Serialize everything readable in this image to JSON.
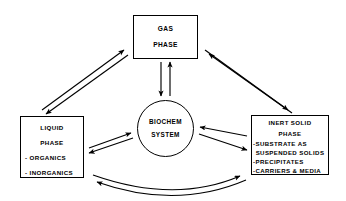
{
  "diagram": {
    "background_color": "#ffffff",
    "stroke_color": "#000000",
    "nodes": {
      "gas_phase": {
        "name": "gas-phase",
        "shape": "rectangle",
        "line1": "GAS",
        "line2": "PHASE"
      },
      "liquid_phase": {
        "name": "liquid-phase",
        "shape": "rectangle",
        "line1": "LIQUID",
        "line2": "PHASE",
        "item1": "- ORGANICS",
        "item2": "- INORGANICS"
      },
      "inert_solid_phase": {
        "name": "inert-solid-phase",
        "shape": "rectangle",
        "line1": "INERT SOLID",
        "line2": "PHASE",
        "item1": "-SUBSTRATE  AS",
        "item1_cont": "SUSPENDED  SOLIDS",
        "item2": "-PRECIPITATES",
        "item3": "-CARRIERS  &  MEDIA"
      },
      "biochem_system": {
        "name": "biochem-system",
        "shape": "circle",
        "line1": "BIOCHEM",
        "line2": "SYSTEM"
      }
    },
    "connectors": [
      {
        "name": "liquid-to-gas-arrow",
        "from": "liquid-phase",
        "to": "gas-phase",
        "style": "straight",
        "direction": "up-right"
      },
      {
        "name": "gas-to-liquid-arrow",
        "from": "gas-phase",
        "to": "liquid-phase",
        "style": "straight",
        "direction": "down-left"
      },
      {
        "name": "gas-to-inert-solid-arrow",
        "from": "gas-phase",
        "to": "inert-solid-phase",
        "style": "straight",
        "direction": "down-right"
      },
      {
        "name": "inert-solid-to-gas-arrow",
        "from": "inert-solid-phase",
        "to": "gas-phase",
        "style": "straight",
        "direction": "up-left"
      },
      {
        "name": "gas-to-biochem-arrow",
        "from": "gas-phase",
        "to": "biochem-system",
        "style": "straight",
        "direction": "down"
      },
      {
        "name": "biochem-to-gas-arrow",
        "from": "biochem-system",
        "to": "gas-phase",
        "style": "straight",
        "direction": "up"
      },
      {
        "name": "liquid-to-biochem-arrow",
        "from": "liquid-phase",
        "to": "biochem-system",
        "style": "straight",
        "direction": "right"
      },
      {
        "name": "biochem-to-liquid-arrow",
        "from": "biochem-system",
        "to": "liquid-phase",
        "style": "straight",
        "direction": "left"
      },
      {
        "name": "biochem-to-inert-solid-arrow",
        "from": "biochem-system",
        "to": "inert-solid-phase",
        "style": "straight",
        "direction": "right"
      },
      {
        "name": "inert-solid-to-biochem-arrow",
        "from": "inert-solid-phase",
        "to": "biochem-system",
        "style": "straight",
        "direction": "left"
      },
      {
        "name": "liquid-to-inert-solid-curve-arrow",
        "from": "liquid-phase",
        "to": "inert-solid-phase",
        "style": "curved",
        "direction": "right"
      },
      {
        "name": "inert-solid-to-liquid-curve-arrow",
        "from": "inert-solid-phase",
        "to": "liquid-phase",
        "style": "curved",
        "direction": "left"
      }
    ]
  }
}
